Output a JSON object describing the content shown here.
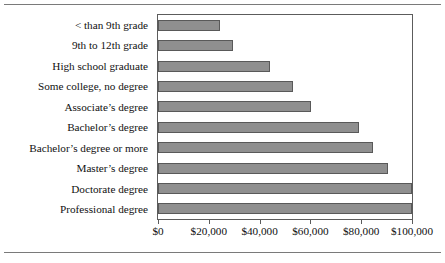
{
  "chart_data": {
    "type": "bar",
    "orientation": "horizontal",
    "title": "",
    "subtitle": "",
    "xlabel": "",
    "ylabel": "",
    "xlim": [
      0,
      100000
    ],
    "grid": false,
    "legend": null,
    "xticks": [
      0,
      20000,
      40000,
      60000,
      80000,
      100000
    ],
    "xtick_labels": [
      "$0",
      "$20,000",
      "$40,000",
      "$60,000",
      "$80,000",
      "$100,000"
    ],
    "categories": [
      "< than 9th grade",
      "9th to 12th grade",
      "High school graduate",
      "Some college, no degree",
      "Associate’s degree",
      "Bachelor’s degree",
      "Bachelor’s degree or more",
      "Master’s degree",
      "Doctorate degree",
      "Professional degree"
    ],
    "values": [
      24600,
      29600,
      43900,
      53200,
      60400,
      79300,
      84800,
      90700,
      100000,
      100000
    ],
    "bar_color": "#8f8f8f",
    "bar_edge_color": "#595959",
    "axis_color": "#5c5c5c",
    "background": "#ffffff"
  }
}
